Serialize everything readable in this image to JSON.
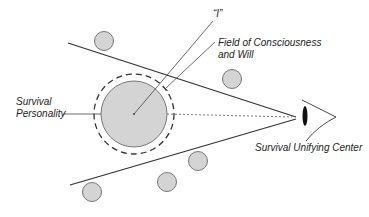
{
  "diagram": {
    "labels": {
      "i": "“I”",
      "field_line1": "Field of Consciousness",
      "field_line2": "and Will",
      "survival_line1": "Survival",
      "survival_line2": "Personality",
      "unifying_center": "Survival Unifying Center"
    },
    "colors": {
      "stroke": "#333333",
      "circle_fill": "#d4d4d4",
      "circle_stroke": "#777777",
      "eye_pupil": "#111111"
    },
    "icons": {
      "eye": "eye-icon"
    }
  }
}
